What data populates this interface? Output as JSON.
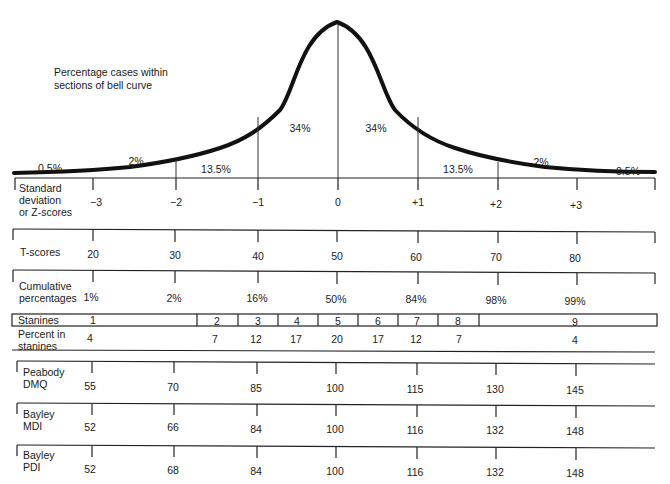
{
  "title": {
    "line1": "Percentage cases within",
    "line2": "sections of bell curve"
  },
  "curve_sections": [
    {
      "label": "0.5%",
      "x": 50,
      "y": 163
    },
    {
      "label": "2%",
      "x": 136,
      "y": 156
    },
    {
      "label": "13.5%",
      "x": 216,
      "y": 163
    },
    {
      "label": "34%",
      "x": 300,
      "y": 121
    },
    {
      "label": "34%",
      "x": 375,
      "y": 121
    },
    {
      "label": "13.5%",
      "x": 457,
      "y": 163
    },
    {
      "label": "2%",
      "x": 540,
      "y": 156
    },
    {
      "label": "0.5%",
      "x": 628,
      "y": 165
    }
  ],
  "tick_x": [
    93,
    176,
    258,
    337,
    418,
    498,
    577
  ],
  "rows": {
    "zscores": {
      "label_lines": [
        "Standard",
        "deviation",
        "or Z-scores"
      ],
      "values": [
        "−3",
        "−2",
        "−1",
        "0",
        "+1",
        "+2",
        "+3"
      ]
    },
    "tscores": {
      "label_lines": [
        "T-scores"
      ],
      "values": [
        "20",
        "30",
        "40",
        "50",
        "60",
        "70",
        "80"
      ]
    },
    "cumulative": {
      "label_lines": [
        "Cumulative",
        "percentages"
      ],
      "values": [
        "1%",
        "2%",
        "16%",
        "50%",
        "84%",
        "98%",
        "99%"
      ]
    },
    "stanines": {
      "label": "Stanines",
      "cells": [
        "1",
        "2",
        "3",
        "4",
        "5",
        "6",
        "7",
        "8",
        "9"
      ],
      "percent_label_lines": [
        "Percent in",
        "stanines"
      ],
      "percents": [
        "4",
        "7",
        "12",
        "17",
        "20",
        "17",
        "12",
        "7",
        "4"
      ]
    },
    "peabody": {
      "label_lines": [
        "Peabody",
        "DMQ"
      ],
      "values": [
        "55",
        "70",
        "85",
        "100",
        "115",
        "130",
        "145"
      ]
    },
    "bayley_mdi": {
      "label_lines": [
        "Bayley",
        "MDI"
      ],
      "values": [
        "52",
        "66",
        "84",
        "100",
        "116",
        "132",
        "148"
      ]
    },
    "bayley_pdi": {
      "label_lines": [
        "Bayley",
        "PDI"
      ],
      "values": [
        "52",
        "68",
        "84",
        "100",
        "116",
        "132",
        "148"
      ]
    }
  },
  "colors": {
    "line": "#111111",
    "text": "#1a1a1a",
    "background": "#ffffff"
  }
}
